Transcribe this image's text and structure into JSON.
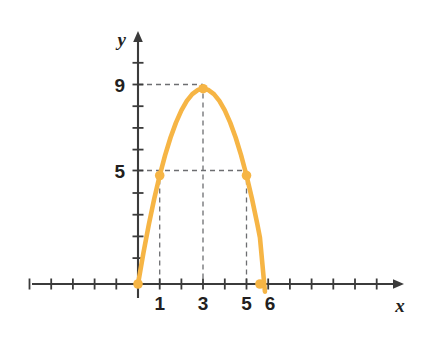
{
  "figure": {
    "background_color": "#ffffff",
    "axis_color": "#3b3b3b",
    "curve_color": "#f6b545",
    "point_color": "#f6b545",
    "guide_color": "#6d6e71",
    "label_color": "#231f20"
  },
  "chart_data": {
    "type": "line",
    "title": "",
    "xlabel": "x",
    "ylabel": "y",
    "xlim": [
      -5,
      12
    ],
    "ylim": [
      -1.2,
      11.5
    ],
    "grid": false,
    "legend": null,
    "function": "y = -x^2 + 6x",
    "x_tick_labels": [
      {
        "value": 1,
        "label": "1"
      },
      {
        "value": 3,
        "label": "3"
      },
      {
        "value": 5,
        "label": "5"
      },
      {
        "value": 6,
        "label": "6"
      }
    ],
    "y_tick_labels": [
      {
        "value": 5,
        "label": "5"
      },
      {
        "value": 9,
        "label": "9"
      }
    ],
    "x_ticks_unlabeled": [
      -5,
      -4,
      -3,
      -2,
      -1,
      2,
      4,
      7,
      8,
      9,
      10,
      11
    ],
    "y_ticks_unlabeled": [
      1,
      2,
      3,
      4,
      6,
      7,
      8,
      10
    ],
    "points": [
      {
        "x": 0,
        "y": 0,
        "label": "(0, 0)"
      },
      {
        "x": 1,
        "y": 5,
        "label": "(1, 5)"
      },
      {
        "x": 3,
        "y": 9,
        "label": "(3, 9)"
      },
      {
        "x": 5,
        "y": 5,
        "label": "(5, 5)"
      },
      {
        "x": 5.62,
        "y": 0,
        "label": "(5.6, 0)"
      }
    ],
    "dashed_guides": [
      {
        "from": [
          0,
          9
        ],
        "to": [
          3,
          9
        ],
        "orientation": "horizontal"
      },
      {
        "from": [
          0,
          5
        ],
        "to": [
          5,
          5
        ],
        "orientation": "horizontal"
      },
      {
        "from": [
          1,
          0
        ],
        "to": [
          1,
          5
        ],
        "orientation": "vertical"
      },
      {
        "from": [
          3,
          0
        ],
        "to": [
          3,
          9
        ],
        "orientation": "vertical"
      },
      {
        "from": [
          5,
          0
        ],
        "to": [
          5,
          5
        ],
        "orientation": "vertical"
      }
    ],
    "x": [
      0,
      0.25,
      0.5,
      0.75,
      1,
      1.25,
      1.5,
      1.75,
      2,
      2.25,
      2.5,
      2.75,
      3,
      3.25,
      3.5,
      3.75,
      4,
      4.25,
      4.5,
      4.75,
      5,
      5.25,
      5.5,
      5.62
    ],
    "y": [
      0,
      1.4375,
      2.75,
      3.9375,
      5,
      5.9375,
      6.75,
      7.4375,
      8,
      8.4375,
      8.75,
      8.9375,
      9,
      8.9375,
      8.75,
      8.4375,
      8,
      7.4375,
      6.75,
      5.9375,
      5,
      3.9375,
      2.75,
      2.1356
    ]
  }
}
